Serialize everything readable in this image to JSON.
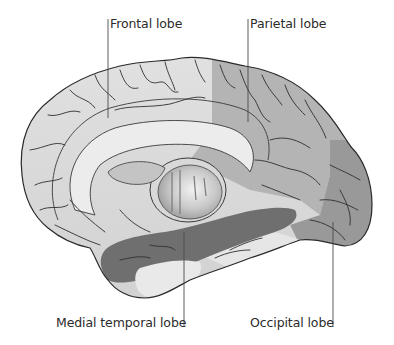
{
  "figure": {
    "labels": {
      "frontal": "Frontal lobe",
      "parietal": "Parietal lobe",
      "medial_temporal": "Medial temporal lobe",
      "occipital": "Occipital lobe"
    },
    "colors": {
      "frontal": "#dedede",
      "parietal": "#b4b4b4",
      "occipital": "#999999",
      "medial_temporal": "#6f6f6f",
      "uncolored": "#e8e8e8",
      "outline": "#2a2a2a",
      "leader_line": "#4a4a4a",
      "text": "#2b2b2b"
    }
  }
}
